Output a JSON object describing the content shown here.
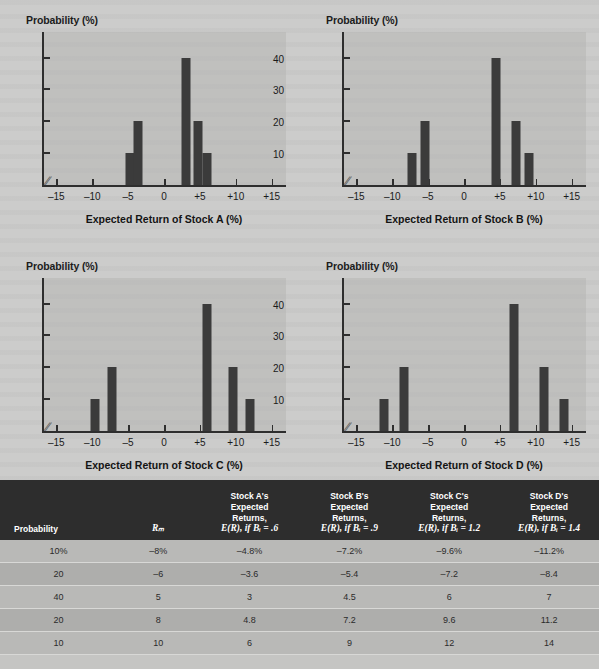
{
  "chart_data": [
    {
      "id": "A",
      "type": "bar",
      "ylabel": "Probability (%)",
      "xlabel": "Expected Return of Stock A (%)",
      "ylim": [
        0,
        48
      ],
      "yticks": [
        10,
        20,
        30,
        40
      ],
      "ytick_labels": [
        "10",
        "20",
        "30",
        "40"
      ],
      "xlim": [
        -17,
        17
      ],
      "xticks": [
        -15,
        -10,
        -5,
        0,
        5,
        10,
        15
      ],
      "xtick_labels": [
        "–15",
        "–10",
        "–5",
        "0",
        "+5",
        "+10",
        "+15"
      ],
      "axis_break": true,
      "grid": false,
      "x": [
        -4.8,
        -3.6,
        3,
        4.8,
        6
      ],
      "values": [
        10,
        20,
        40,
        20,
        10
      ]
    },
    {
      "id": "B",
      "type": "bar",
      "ylabel": "Probability (%)",
      "xlabel": "Expected Return of Stock B (%)",
      "ylim": [
        0,
        48
      ],
      "yticks": [
        10,
        20,
        30,
        40
      ],
      "ytick_labels": [
        "10",
        "20",
        "30",
        "40"
      ],
      "xlim": [
        -17,
        17
      ],
      "xticks": [
        -15,
        -10,
        -5,
        0,
        5,
        10,
        15
      ],
      "xtick_labels": [
        "–15",
        "–10",
        "–5",
        "0",
        "+5",
        "+10",
        "+15"
      ],
      "axis_break": true,
      "grid": false,
      "x": [
        -7.2,
        -5.4,
        4.5,
        7.2,
        9
      ],
      "values": [
        10,
        20,
        40,
        20,
        10
      ]
    },
    {
      "id": "C",
      "type": "bar",
      "ylabel": "Probability (%)",
      "xlabel": "Expected Return of Stock C (%)",
      "ylim": [
        0,
        48
      ],
      "yticks": [
        10,
        20,
        30,
        40
      ],
      "ytick_labels": [
        "10",
        "20",
        "30",
        "40"
      ],
      "xlim": [
        -17,
        17
      ],
      "xticks": [
        -15,
        -10,
        -5,
        0,
        5,
        10,
        15
      ],
      "xtick_labels": [
        "–15",
        "–10",
        "–5",
        "0",
        "+5",
        "+10",
        "+15"
      ],
      "axis_break": true,
      "grid": false,
      "x": [
        -9.6,
        -7.2,
        6,
        9.6,
        12
      ],
      "values": [
        10,
        20,
        40,
        20,
        10
      ]
    },
    {
      "id": "D",
      "type": "bar",
      "ylabel": "Probability (%)",
      "xlabel": "Expected Return of Stock D (%)",
      "ylim": [
        0,
        48
      ],
      "yticks": [
        10,
        20,
        30,
        40
      ],
      "ytick_labels": [
        "10",
        "20",
        "30",
        "40"
      ],
      "xlim": [
        -17,
        17
      ],
      "xticks": [
        -15,
        -10,
        -5,
        0,
        5,
        10,
        15
      ],
      "xtick_labels": [
        "–15",
        "–10",
        "–5",
        "0",
        "+5",
        "+10",
        "+15"
      ],
      "axis_break": true,
      "grid": false,
      "x": [
        -11.2,
        -8.4,
        7,
        11.2,
        14
      ],
      "values": [
        10,
        20,
        40,
        20,
        10
      ]
    }
  ],
  "table": {
    "type": "table",
    "headers": [
      {
        "line1": "",
        "line2": "",
        "line3": "",
        "line4": "Probability"
      },
      {
        "line1": "",
        "line2": "",
        "line3": "",
        "line4": "Rₘ"
      },
      {
        "line1": "Stock A's",
        "line2": "Expected",
        "line3": "Returns,",
        "line4": "E(R), if Bᵢ = .6"
      },
      {
        "line1": "Stock B's",
        "line2": "Expected",
        "line3": "Returns,",
        "line4": "E(R), if Bᵢ = .9"
      },
      {
        "line1": "Stock C's",
        "line2": "Expected",
        "line3": "Returns,",
        "line4": "E(R), if Bᵢ = 1.2"
      },
      {
        "line1": "Stock D's",
        "line2": "Expected",
        "line3": "Returns,",
        "line4": "E(R), if Bᵢ = 1.4"
      }
    ],
    "rows": [
      [
        "10%",
        "–8%",
        "–4.8%",
        "–7.2%",
        "–9.6%",
        "–11.2%"
      ],
      [
        "20",
        "–6",
        "–3.6",
        "–5.4",
        "–7.2",
        "–8.4"
      ],
      [
        "40",
        "5",
        "3",
        "4.5",
        "6",
        "7"
      ],
      [
        "20",
        "8",
        "4.8",
        "7.2",
        "9.6",
        "11.2"
      ],
      [
        "10",
        "10",
        "6",
        "9",
        "12",
        "14"
      ]
    ]
  },
  "colors": {
    "bar": "#3b3b3b",
    "axis": "#2e2e2e",
    "page_bg": "#cccccb",
    "plot_bg": "#b2b2b0",
    "table_header_bg": "#2d2d2d",
    "table_row_odd": "#b9b9b7",
    "table_row_even": "#aeaeac"
  }
}
